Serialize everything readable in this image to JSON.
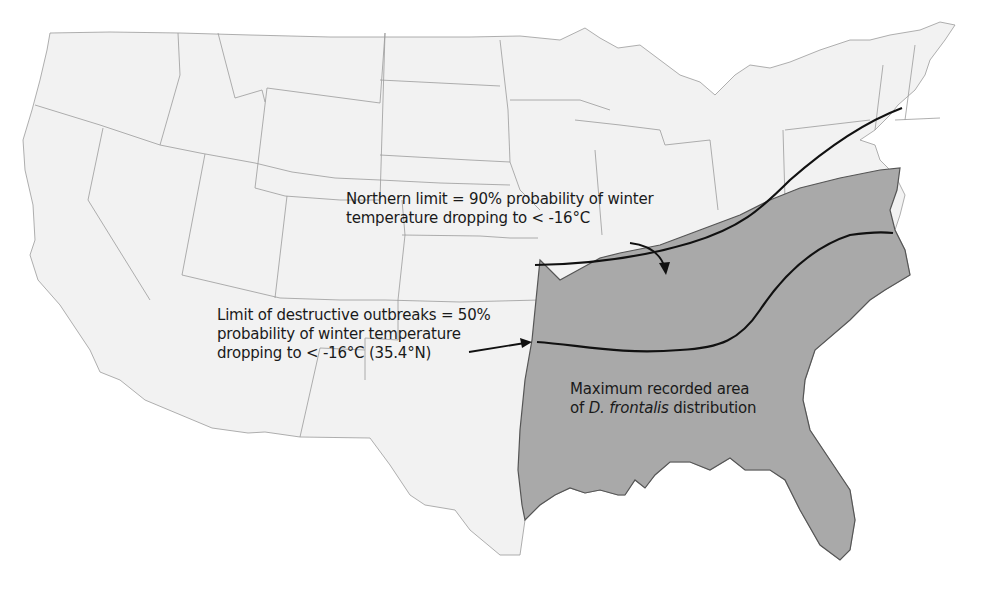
{
  "figure": {
    "colors": {
      "land": "#f2f2f2",
      "state_border": "#9a9a9a",
      "distribution_area": "#a9a9a9",
      "distribution_border": "#555555",
      "limit_line": "#111111",
      "background": "#ffffff"
    },
    "annotations": {
      "northern_limit": {
        "line1": "Northern limit = 90% probability of winter",
        "line2": "temperature dropping to < -16°C"
      },
      "destructive_limit": {
        "line1": "Limit of destructive outbreaks = 50%",
        "line2": "probability of winter temperature",
        "line3": "dropping to < -16°C (35.4°N)"
      },
      "distribution_area": {
        "line1": "Maximum recorded area",
        "line2_prefix": "of ",
        "line2_species": "D. frontalis",
        "line2_suffix": " distribution"
      }
    }
  }
}
